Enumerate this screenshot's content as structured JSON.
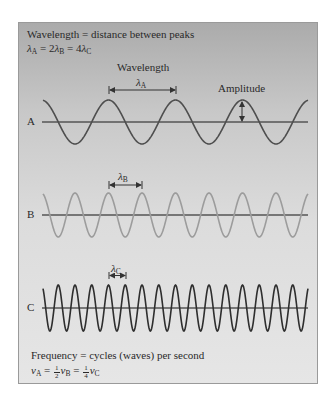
{
  "header": {
    "line1": "Wavelength = distance between peaks",
    "line2": {
      "lambda": "λ",
      "subA": "A",
      "eq1": " = 2",
      "subB": "B",
      "eq2": " = 4",
      "subC": "C"
    }
  },
  "annotations": {
    "wavelength_title": "Wavelength",
    "amplitude": "Amplitude",
    "lambdaA": {
      "sym": "λ",
      "sub": "A"
    },
    "lambdaB": {
      "sym": "λ",
      "sub": "B"
    },
    "lambdaC": {
      "sym": "λ",
      "sub": "C"
    }
  },
  "waves": [
    {
      "label": "A",
      "color": "#4e4e4e",
      "wavelength_px": 67,
      "amplitude_px": 22,
      "axis_y": 122,
      "relative_wavelength": 4
    },
    {
      "label": "B",
      "color": "#9c9c9c",
      "wavelength_px": 33.5,
      "amplitude_px": 22,
      "axis_y": 215,
      "relative_wavelength": 2
    },
    {
      "label": "C",
      "color": "#2e2e2e",
      "wavelength_px": 16.75,
      "amplitude_px": 23,
      "axis_y": 308,
      "relative_wavelength": 1
    }
  ],
  "footer": {
    "line1": "Frequency = cycles (waves) per second",
    "line2": {
      "nu": "ν",
      "subA": "A",
      "eq": " = ",
      "half_num": "1",
      "half_den": "2",
      "subB": "B",
      "quarter_num": "1",
      "quarter_den": "4",
      "subC": "C"
    }
  },
  "colors": {
    "axis": "#555555",
    "text": "#2a2a2a",
    "bracket": "#333333"
  }
}
